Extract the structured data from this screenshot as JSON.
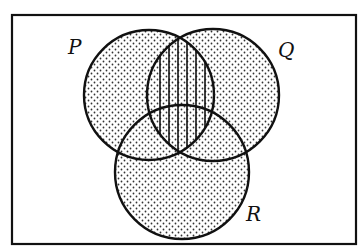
{
  "diagram": {
    "type": "venn",
    "sets": [
      {
        "name": "P",
        "label": "P"
      },
      {
        "name": "Q",
        "label": "Q"
      },
      {
        "name": "R",
        "label": "R"
      }
    ],
    "shading": {
      "dotted": "P ∪ Q ∪ R",
      "vertical_hatch": "P ∩ Q"
    },
    "colors": {
      "stroke": "#111111",
      "background": "#ffffff",
      "dots": "#333333"
    }
  }
}
